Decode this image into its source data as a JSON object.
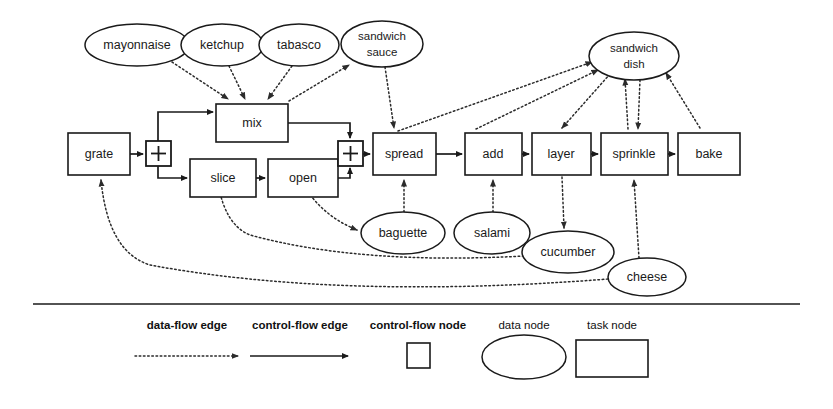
{
  "diagram": {
    "colors": {
      "stroke": "#1a1a1a",
      "background": "#ffffff",
      "data_flow_edge": "#2b2b2b"
    },
    "task_nodes": [
      {
        "id": "grate",
        "label": "grate",
        "x": 68,
        "y": 133,
        "w": 62,
        "h": 42
      },
      {
        "id": "mix",
        "label": "mix",
        "x": 216,
        "y": 104,
        "w": 72,
        "h": 38
      },
      {
        "id": "slice",
        "label": "slice",
        "x": 190,
        "y": 159,
        "w": 66,
        "h": 38
      },
      {
        "id": "open",
        "label": "open",
        "x": 268,
        "y": 159,
        "w": 70,
        "h": 38
      },
      {
        "id": "spread",
        "label": "spread",
        "x": 373,
        "y": 133,
        "w": 63,
        "h": 42
      },
      {
        "id": "add",
        "label": "add",
        "x": 465,
        "y": 133,
        "w": 57,
        "h": 42
      },
      {
        "id": "layer",
        "label": "layer",
        "x": 532,
        "y": 133,
        "w": 59,
        "h": 42
      },
      {
        "id": "sprinkle",
        "label": "sprinkle",
        "x": 601,
        "y": 133,
        "w": 67,
        "h": 42
      },
      {
        "id": "bake",
        "label": "bake",
        "x": 678,
        "y": 133,
        "w": 62,
        "h": 42
      }
    ],
    "data_nodes": [
      {
        "id": "mayonnaise",
        "label": "mayonnaise",
        "cx": 137,
        "cy": 45,
        "rx": 52,
        "ry": 21
      },
      {
        "id": "ketchup",
        "label": "ketchup",
        "cx": 222,
        "cy": 45,
        "rx": 41,
        "ry": 21
      },
      {
        "id": "tabasco",
        "label": "tabasco",
        "cx": 299,
        "cy": 45,
        "rx": 40,
        "ry": 21
      },
      {
        "id": "sandwich-sauce",
        "label": "sandwich\nsauce",
        "cx": 382,
        "cy": 44,
        "rx": 41,
        "ry": 23
      },
      {
        "id": "sandwich-dish",
        "label": "sandwich\ndish",
        "cx": 634,
        "cy": 56,
        "rx": 45,
        "ry": 24
      },
      {
        "id": "baguette",
        "label": "baguette",
        "cx": 403,
        "cy": 233,
        "rx": 42,
        "ry": 21
      },
      {
        "id": "salami",
        "label": "salami",
        "cx": 492,
        "cy": 233,
        "rx": 38,
        "ry": 21
      },
      {
        "id": "cucumber",
        "label": "cucumber",
        "cx": 568,
        "cy": 252,
        "rx": 46,
        "ry": 21
      },
      {
        "id": "cheese",
        "label": "cheese",
        "cx": 647,
        "cy": 277,
        "rx": 39,
        "ry": 19
      }
    ],
    "control_flow_nodes": [
      {
        "id": "split-plus",
        "label": "+",
        "x": 146,
        "y": 141,
        "size": 24
      },
      {
        "id": "join-plus",
        "label": "+",
        "x": 338,
        "y": 141,
        "size": 24
      }
    ],
    "control_flow_edges": [
      {
        "from": "grate",
        "to": "split-plus"
      },
      {
        "from": "split-plus",
        "to": "mix"
      },
      {
        "from": "split-plus",
        "to": "slice"
      },
      {
        "from": "slice",
        "to": "open"
      },
      {
        "from": "mix",
        "to": "join-plus"
      },
      {
        "from": "open",
        "to": "join-plus"
      },
      {
        "from": "join-plus",
        "to": "spread"
      },
      {
        "from": "spread",
        "to": "add"
      },
      {
        "from": "add",
        "to": "layer"
      },
      {
        "from": "layer",
        "to": "sprinkle"
      },
      {
        "from": "sprinkle",
        "to": "bake"
      }
    ],
    "data_flow_edges": [
      {
        "from": "mayonnaise",
        "to": "mix"
      },
      {
        "from": "ketchup",
        "to": "mix"
      },
      {
        "from": "tabasco",
        "to": "mix"
      },
      {
        "from": "mix",
        "to": "sandwich-sauce"
      },
      {
        "from": "sandwich-sauce",
        "to": "spread"
      },
      {
        "from": "spread",
        "to": "sandwich-dish"
      },
      {
        "from": "add",
        "to": "sandwich-dish"
      },
      {
        "from": "sandwich-dish",
        "to": "layer"
      },
      {
        "from": "sprinkle",
        "to": "sandwich-dish"
      },
      {
        "from": "sandwich-dish",
        "to": "sprinkle"
      },
      {
        "from": "bake",
        "to": "sandwich-dish"
      },
      {
        "from": "baguette",
        "to": "spread"
      },
      {
        "from": "salami",
        "to": "add"
      },
      {
        "from": "layer",
        "to": "cucumber"
      },
      {
        "from": "cheese",
        "to": "sprinkle"
      },
      {
        "from": "open",
        "to": "baguette"
      },
      {
        "from": "cucumber",
        "to": "slice"
      },
      {
        "from": "cheese",
        "to": "grate"
      }
    ]
  },
  "legend": {
    "items": [
      {
        "id": "data-flow-edge",
        "label": "data-flow edge",
        "bold": true,
        "symbol": "dotted-arrow",
        "label_x": 187,
        "label_y": 326,
        "sym_x": 187,
        "sym_y": 356
      },
      {
        "id": "control-flow-edge",
        "label": "control-flow edge",
        "bold": true,
        "symbol": "solid-arrow",
        "label_x": 300,
        "label_y": 326,
        "sym_x": 300,
        "sym_y": 356
      },
      {
        "id": "control-flow-node",
        "label": "control-flow node",
        "bold": true,
        "symbol": "square",
        "label_x": 418,
        "label_y": 326,
        "sym_x": 418,
        "sym_y": 356
      },
      {
        "id": "data-node",
        "label": "data node",
        "bold": false,
        "symbol": "ellipse",
        "label_x": 524,
        "label_y": 326,
        "sym_x": 524,
        "sym_y": 356
      },
      {
        "id": "task-node",
        "label": "task node",
        "bold": false,
        "symbol": "rectangle",
        "label_x": 612,
        "label_y": 326,
        "sym_x": 612,
        "sym_y": 358
      }
    ],
    "separator": {
      "x1": 33,
      "y1": 303,
      "x2": 800,
      "y2": 305
    }
  }
}
